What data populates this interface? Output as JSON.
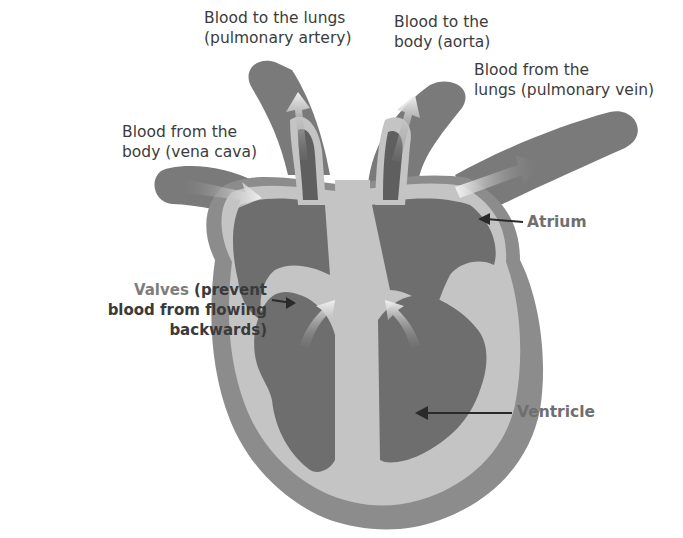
{
  "diagram": {
    "colors": {
      "outer_wall": "#8a8a8a",
      "inner_wall": "#c4c4c4",
      "chamber": "#6e6e6e",
      "vessel": "#7a7a7a",
      "flow_arrow": "#e8e8e8",
      "pointer": "#2a2a2a",
      "label_text": "#3c3c3c",
      "accent_text": "#7d7d7d"
    },
    "labels": {
      "pulmonary_artery": {
        "line1": "Blood to the lungs",
        "line2": "(pulmonary artery)"
      },
      "aorta": {
        "line1": "Blood to the",
        "line2": "body (aorta)"
      },
      "pulmonary_vein": {
        "line1": "Blood from the",
        "line2": "lungs (pulmonary vein)"
      },
      "vena_cava": {
        "line1": "Blood from the",
        "line2": "body (vena cava)"
      },
      "valves": {
        "term": "Valves",
        "line1_rest": " (prevent",
        "line2": "blood from flowing",
        "line3": "backwards)"
      },
      "atrium": "Atrium",
      "ventricle": "Ventricle"
    }
  }
}
